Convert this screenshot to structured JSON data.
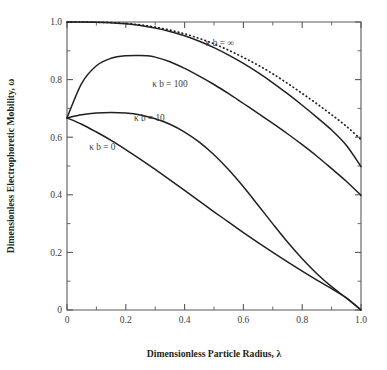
{
  "chart_data": {
    "type": "line",
    "title": "",
    "subtitle": "",
    "xlabel": "Dimensionless Particle Radius, λ",
    "ylabel": "Dimensionless Electrophoretic Mobility, ω",
    "xlim": [
      0,
      1.0
    ],
    "ylim": [
      0,
      1.0
    ],
    "grid": false,
    "legend_position": "inline-annotations",
    "x_ticks": [
      "0",
      "0.2",
      "0.4",
      "0.6",
      "0.8",
      "1.0"
    ],
    "x_tick_values": [
      0,
      0.2,
      0.4,
      0.6,
      0.8,
      1.0
    ],
    "x_minor_tick_values": [
      0.1,
      0.3,
      0.5,
      0.7,
      0.9
    ],
    "y_ticks": [
      "0",
      "0.2",
      "0.4",
      "0.6",
      "0.8",
      "1.0"
    ],
    "y_tick_values": [
      0,
      0.2,
      0.4,
      0.6,
      0.8,
      1.0
    ],
    "y_minor_tick_values": [
      0.1,
      0.3,
      0.5,
      0.7,
      0.9
    ],
    "series": [
      {
        "name": "κ b = ∞",
        "style": "dotted",
        "x": [
          0.0,
          0.05,
          0.1,
          0.15,
          0.2,
          0.25,
          0.3,
          0.35,
          0.4,
          0.45,
          0.5,
          0.55,
          0.6,
          0.65,
          0.7,
          0.75,
          0.8,
          0.85,
          0.9,
          0.95,
          1.0
        ],
        "values": [
          1.0,
          1.0,
          0.999,
          0.998,
          0.995,
          0.99,
          0.982,
          0.972,
          0.959,
          0.943,
          0.924,
          0.902,
          0.877,
          0.85,
          0.82,
          0.787,
          0.752,
          0.716,
          0.678,
          0.638,
          0.592
        ]
      },
      {
        "name": "κ b = 100",
        "style": "solid",
        "x": [
          0.0,
          0.05,
          0.1,
          0.15,
          0.2,
          0.25,
          0.3,
          0.35,
          0.4,
          0.45,
          0.5,
          0.55,
          0.6,
          0.65,
          0.7,
          0.75,
          0.8,
          0.85,
          0.9,
          0.95,
          1.0
        ],
        "values": [
          1.0,
          1.0,
          0.999,
          0.997,
          0.994,
          0.988,
          0.979,
          0.967,
          0.952,
          0.933,
          0.911,
          0.885,
          0.856,
          0.824,
          0.789,
          0.751,
          0.711,
          0.669,
          0.625,
          0.572,
          0.498
        ]
      },
      {
        "name": "κ b = 10",
        "style": "solid",
        "x": [
          0.0,
          0.05,
          0.1,
          0.15,
          0.2,
          0.25,
          0.27,
          0.3,
          0.35,
          0.4,
          0.45,
          0.5,
          0.55,
          0.6,
          0.65,
          0.7,
          0.75,
          0.8,
          0.85,
          0.9,
          0.95,
          1.0
        ],
        "values": [
          0.667,
          0.787,
          0.848,
          0.874,
          0.883,
          0.884,
          0.883,
          0.878,
          0.862,
          0.839,
          0.812,
          0.783,
          0.751,
          0.717,
          0.683,
          0.648,
          0.612,
          0.574,
          0.534,
          0.491,
          0.447,
          0.398
        ]
      },
      {
        "name": "κ b = 0",
        "style": "solid",
        "x": [
          0.0,
          0.05,
          0.1,
          0.15,
          0.2,
          0.25,
          0.3,
          0.35,
          0.4,
          0.45,
          0.5,
          0.55,
          0.6,
          0.65,
          0.7,
          0.75,
          0.8,
          0.85,
          0.9,
          0.95,
          1.0
        ],
        "values": [
          0.667,
          0.678,
          0.684,
          0.686,
          0.684,
          0.677,
          0.664,
          0.645,
          0.618,
          0.583,
          0.539,
          0.487,
          0.428,
          0.364,
          0.299,
          0.236,
          0.178,
          0.126,
          0.081,
          0.042,
          0.0
        ]
      },
      {
        "name": "lower",
        "style": "solid",
        "x": [
          0.0,
          0.05,
          0.1,
          0.15,
          0.2,
          0.25,
          0.3,
          0.35,
          0.4,
          0.45,
          0.5,
          0.55,
          0.6,
          0.65,
          0.7,
          0.75,
          0.8,
          0.85,
          0.9,
          0.95,
          1.0
        ],
        "values": [
          0.667,
          0.645,
          0.618,
          0.589,
          0.557,
          0.523,
          0.488,
          0.452,
          0.415,
          0.378,
          0.341,
          0.305,
          0.269,
          0.234,
          0.2,
          0.167,
          0.135,
          0.104,
          0.074,
          0.042,
          0.0
        ]
      }
    ],
    "annotations": [
      {
        "text": "κ b = ∞",
        "x": 0.52,
        "y": 0.915
      },
      {
        "text": "κ b = 100",
        "x": 0.35,
        "y": 0.775
      },
      {
        "text": "κ b = 10",
        "x": 0.28,
        "y": 0.655
      },
      {
        "text": "κ b = 0",
        "x": 0.12,
        "y": 0.555
      }
    ]
  }
}
